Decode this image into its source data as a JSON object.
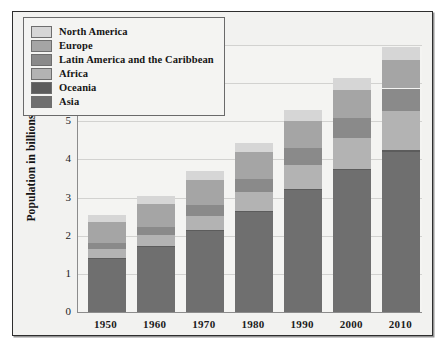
{
  "chart_data": {
    "type": "bar",
    "subtype": "stacked-bar",
    "title": "",
    "xlabel": "",
    "ylabel": "Population in billions",
    "categories": [
      "1950",
      "1960",
      "1970",
      "1980",
      "1990",
      "2000",
      "2010"
    ],
    "ylim": [
      0,
      7
    ],
    "yticks": [
      0,
      1,
      2,
      3,
      4,
      5,
      6,
      7
    ],
    "ytick_labels": [
      "0",
      "1",
      "2",
      "3",
      "4",
      "5",
      "6",
      "7"
    ],
    "grid": "horizontal",
    "legend_position": "upper-left-inside",
    "stack_order_bottom_to_top": [
      "Asia",
      "Oceania",
      "Africa",
      "Latin America and the Caribbean",
      "Europe",
      "North America"
    ],
    "series": [
      {
        "name": "Asia",
        "color": "#6f6f6f",
        "values": [
          1.4,
          1.72,
          2.14,
          2.64,
          3.2,
          3.73,
          4.2
        ]
      },
      {
        "name": "Oceania",
        "color": "#5c5c5c",
        "values": [
          0.02,
          0.02,
          0.02,
          0.02,
          0.03,
          0.03,
          0.04
        ]
      },
      {
        "name": "Africa",
        "color": "#b3b3b3",
        "values": [
          0.23,
          0.28,
          0.36,
          0.48,
          0.63,
          0.81,
          1.03
        ]
      },
      {
        "name": "Latin America and the Caribbean",
        "color": "#8a8a8a",
        "values": [
          0.17,
          0.22,
          0.29,
          0.36,
          0.44,
          0.52,
          0.59
        ]
      },
      {
        "name": "Europe",
        "color": "#a5a5a5",
        "values": [
          0.55,
          0.6,
          0.66,
          0.69,
          0.72,
          0.73,
          0.74
        ]
      },
      {
        "name": "North America",
        "color": "#d6d6d6",
        "values": [
          0.17,
          0.2,
          0.23,
          0.25,
          0.28,
          0.31,
          0.34
        ]
      }
    ],
    "totals": [
      2.44,
      3.04,
      3.7,
      4.44,
      5.3,
      6.13,
      6.94
    ]
  },
  "legend": {
    "entries": [
      {
        "label": "North America",
        "color": "#d6d6d6"
      },
      {
        "label": "Europe",
        "color": "#a5a5a5"
      },
      {
        "label": "Latin America and the Caribbean",
        "color": "#8a8a8a"
      },
      {
        "label": "Africa",
        "color": "#b3b3b3"
      },
      {
        "label": "Oceania",
        "color": "#5c5c5c"
      },
      {
        "label": "Asia",
        "color": "#6f6f6f"
      }
    ]
  },
  "style": {
    "frame_border": "#2e2e2e",
    "plot_background": "#f4f4f2",
    "figure_background": "#f2f2f0",
    "gridline_color": "#d2d2d0",
    "axis_color": "#8c8c8c",
    "text_color": "#141414"
  }
}
